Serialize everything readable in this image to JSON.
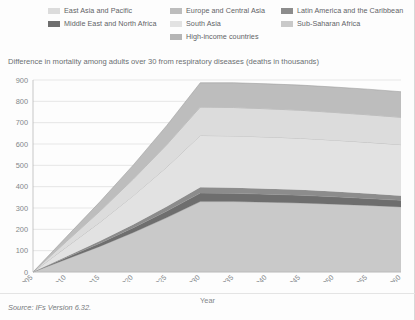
{
  "legend": {
    "items": [
      {
        "label": "East Asia and Pacific",
        "color": "#dcdcdc",
        "col": 0,
        "row": 0
      },
      {
        "label": "Europe and Central Asia",
        "color": "#bdbdbd",
        "col": 1,
        "row": 0
      },
      {
        "label": "Latin America and the Caribbean",
        "color": "#8c8c8c",
        "col": 2,
        "row": 0
      },
      {
        "label": "Middle East and North Africa",
        "color": "#6e6e6e",
        "col": 0,
        "row": 1
      },
      {
        "label": "South Asia",
        "color": "#e2e2e2",
        "col": 1,
        "row": 1
      },
      {
        "label": "Sub-Saharan Africa",
        "color": "#c9c9c9",
        "col": 2,
        "row": 1
      },
      {
        "label": "High-income countries",
        "color": "#b5b5b5",
        "col": 1,
        "row": 2
      }
    ]
  },
  "footer": {
    "source": "Source: IFs Version 6.32."
  },
  "chart_data": {
    "type": "area",
    "stacked": true,
    "title": "Difference in mortality among adults over 30 from respiratory diseases (deaths in thousands)",
    "xlabel": "Year",
    "ylabel": "",
    "ylim": [
      0,
      900
    ],
    "xlim": [
      2005,
      2060
    ],
    "ytick_step": 100,
    "xtick_step": 5,
    "grid": true,
    "legend_position": "top",
    "yticks": [
      0,
      100,
      200,
      300,
      400,
      500,
      600,
      700,
      800,
      900
    ],
    "x": [
      2005,
      2010,
      2015,
      2020,
      2025,
      2030,
      2035,
      2040,
      2045,
      2050,
      2055,
      2060
    ],
    "series": [
      {
        "name": "Sub-Saharan Africa",
        "color": "#c9c9c9",
        "values": [
          0,
          60,
          120,
          185,
          255,
          330,
          330,
          327,
          323,
          318,
          312,
          305
        ]
      },
      {
        "name": "Middle East and North Africa",
        "color": "#6e6e6e",
        "values": [
          0,
          8,
          15,
          23,
          31,
          40,
          39,
          38,
          37,
          35,
          33,
          31
        ]
      },
      {
        "name": "Latin America and the Caribbean",
        "color": "#8c8c8c",
        "values": [
          0,
          5,
          10,
          15,
          21,
          27,
          26,
          25,
          25,
          24,
          23,
          22
        ]
      },
      {
        "name": "South Asia",
        "color": "#e2e2e2",
        "values": [
          0,
          44,
          88,
          135,
          185,
          243,
          243,
          243,
          242,
          241,
          240,
          239
        ]
      },
      {
        "name": "East Asia and Pacific",
        "color": "#dcdcdc",
        "values": [
          0,
          26,
          52,
          78,
          105,
          133,
          133,
          132,
          131,
          130,
          129,
          128
        ]
      },
      {
        "name": "Europe and Central Asia",
        "color": "#bdbdbd",
        "values": [
          0,
          22,
          44,
          66,
          90,
          114,
          116,
          117,
          118,
          119,
          120,
          120
        ]
      },
      {
        "name": "High-income countries",
        "color": "#b5b5b5",
        "values": [
          0,
          0,
          0,
          0,
          0,
          0,
          0,
          0,
          0,
          0,
          0,
          0
        ]
      }
    ],
    "totals": [
      0,
      165,
      329,
      502,
      687,
      887,
      887,
      882,
      876,
      867,
      857,
      845
    ]
  }
}
